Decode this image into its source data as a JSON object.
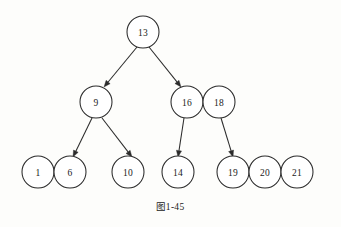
{
  "figure": {
    "caption": "图1-45",
    "caption_x": 170,
    "caption_y": 207,
    "background_color": "#fdfdfb",
    "stroke_color": "#2b2b2b",
    "fill_color": "#ffffff",
    "type": "b-tree-diagram"
  },
  "chart_data": {
    "type": "diagram",
    "title": "图1-45",
    "node_radius": 16,
    "levels": [
      {
        "level": 0,
        "y": 32,
        "groups": [
          {
            "keys": [
              "13"
            ],
            "x_centers": [
              143
            ]
          }
        ]
      },
      {
        "level": 1,
        "y": 102,
        "groups": [
          {
            "keys": [
              "9"
            ],
            "x_centers": [
              96
            ]
          },
          {
            "keys": [
              "16",
              "18"
            ],
            "x_centers": [
              187,
              219
            ]
          }
        ]
      },
      {
        "level": 2,
        "y": 172,
        "groups": [
          {
            "keys": [
              "1",
              "6"
            ],
            "x_centers": [
              38,
              70
            ]
          },
          {
            "keys": [
              "10"
            ],
            "x_centers": [
              128
            ]
          },
          {
            "keys": [
              "14"
            ],
            "x_centers": [
              178
            ]
          },
          {
            "keys": [
              "19",
              "20",
              "21"
            ],
            "x_centers": [
              233,
              265,
              297
            ]
          }
        ]
      }
    ],
    "nodes": [
      {
        "id": "n13",
        "label": "13",
        "cx": 143,
        "cy": 32,
        "r": 16
      },
      {
        "id": "n9",
        "label": "9",
        "cx": 96,
        "cy": 102,
        "r": 16
      },
      {
        "id": "n16",
        "label": "16",
        "cx": 187,
        "cy": 102,
        "r": 16
      },
      {
        "id": "n18",
        "label": "18",
        "cx": 219,
        "cy": 102,
        "r": 16
      },
      {
        "id": "n1",
        "label": "1",
        "cx": 38,
        "cy": 172,
        "r": 16
      },
      {
        "id": "n6",
        "label": "6",
        "cx": 70,
        "cy": 172,
        "r": 16
      },
      {
        "id": "n10",
        "label": "10",
        "cx": 128,
        "cy": 172,
        "r": 16
      },
      {
        "id": "n14",
        "label": "14",
        "cx": 178,
        "cy": 172,
        "r": 16
      },
      {
        "id": "n19",
        "label": "19",
        "cx": 233,
        "cy": 172,
        "r": 16
      },
      {
        "id": "n20",
        "label": "20",
        "cx": 265,
        "cy": 172,
        "r": 16
      },
      {
        "id": "n21",
        "label": "21",
        "cx": 297,
        "cy": 172,
        "r": 16
      }
    ],
    "edges": [
      {
        "from": "n13",
        "to": "n9",
        "x1": 137,
        "y1": 47,
        "x2": 104,
        "y2": 87,
        "arrow": true
      },
      {
        "from": "n13",
        "to": "n16",
        "x1": 149,
        "y1": 47,
        "x2": 181,
        "y2": 87,
        "arrow": true
      },
      {
        "from": "n9",
        "to": "n6",
        "x1": 92,
        "y1": 118,
        "x2": 73,
        "y2": 157,
        "arrow": true
      },
      {
        "from": "n9",
        "to": "n10",
        "x1": 102,
        "y1": 118,
        "x2": 132,
        "y2": 157,
        "arrow": true
      },
      {
        "from": "n16",
        "to": "n14",
        "x1": 184,
        "y1": 118,
        "x2": 178,
        "y2": 157,
        "arrow": true
      },
      {
        "from": "n18",
        "to": "n19",
        "x1": 221,
        "y1": 118,
        "x2": 233,
        "y2": 157,
        "arrow": true
      }
    ]
  }
}
